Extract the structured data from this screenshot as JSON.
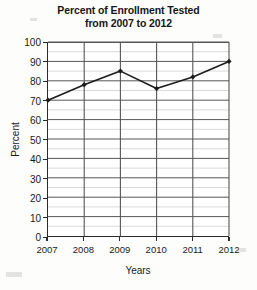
{
  "chart_data": {
    "type": "line",
    "title": "Percent of Enrollment Tested from 2007 to 2012",
    "title_line1": "Percent of Enrollment Tested",
    "title_line2": "from 2007 to 2012",
    "xlabel": "Years",
    "ylabel": "Percent",
    "categories": [
      "2007",
      "2008",
      "2009",
      "2010",
      "2011",
      "2012"
    ],
    "values": [
      70,
      78,
      85,
      76,
      82,
      90
    ],
    "ylim": [
      0,
      100
    ],
    "ytick_labels": [
      "0",
      "10",
      "20",
      "30",
      "40",
      "50",
      "60",
      "70",
      "80",
      "90",
      "100"
    ],
    "ytick_values": [
      0,
      10,
      20,
      30,
      40,
      50,
      60,
      70,
      80,
      90,
      100
    ],
    "minor_gridline_step": 5,
    "grid": true,
    "legend": "none",
    "series_color": "#1c1c1c",
    "grid_color": "#555555",
    "minor_grid_color": "#c8c8c8",
    "axis_color": "#2b2b2b",
    "marker": "diamond"
  }
}
